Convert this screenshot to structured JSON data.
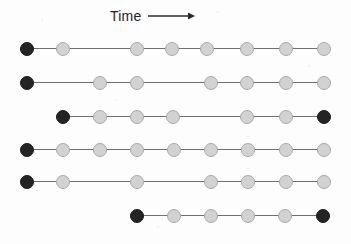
{
  "figure": {
    "width": 351,
    "height": 244,
    "background_color": "#fdfdfd",
    "axis": {
      "label": "Time",
      "arrow_icon": "arrow-right-icon",
      "arrow_direction": "right",
      "arrow_color": "#2b2b2b",
      "label_left": 110,
      "label_top": 7,
      "arrow_length": 46
    },
    "colors": {
      "node_dark": "#242424",
      "node_dark_border": "#1a1a1a",
      "node_light": "#d2d2d2",
      "node_light_border": "#a9a9a9",
      "connector": "#6f6f6f"
    },
    "node_diameter": 14,
    "rows": [
      {
        "name": "timeline-row-1",
        "center_y": 49,
        "nodes": [
          {
            "x": 27,
            "state": "dark"
          },
          {
            "x": 63,
            "state": "light"
          },
          {
            "x": 137,
            "state": "light"
          },
          {
            "x": 172,
            "state": "light"
          },
          {
            "x": 207,
            "state": "light"
          },
          {
            "x": 247,
            "state": "light"
          },
          {
            "x": 286,
            "state": "light"
          },
          {
            "x": 324,
            "state": "light"
          }
        ]
      },
      {
        "name": "timeline-row-2",
        "center_y": 83,
        "nodes": [
          {
            "x": 27,
            "state": "dark"
          },
          {
            "x": 100,
            "state": "light"
          },
          {
            "x": 137,
            "state": "light"
          },
          {
            "x": 211,
            "state": "light"
          },
          {
            "x": 247,
            "state": "light"
          },
          {
            "x": 286,
            "state": "light"
          },
          {
            "x": 324,
            "state": "light"
          }
        ]
      },
      {
        "name": "timeline-row-3",
        "center_y": 117,
        "nodes": [
          {
            "x": 63,
            "state": "dark"
          },
          {
            "x": 100,
            "state": "light"
          },
          {
            "x": 137,
            "state": "light"
          },
          {
            "x": 173,
            "state": "light"
          },
          {
            "x": 247,
            "state": "light"
          },
          {
            "x": 286,
            "state": "light"
          },
          {
            "x": 324,
            "state": "dark"
          }
        ]
      },
      {
        "name": "timeline-row-4",
        "center_y": 150,
        "nodes": [
          {
            "x": 27,
            "state": "dark"
          },
          {
            "x": 63,
            "state": "light"
          },
          {
            "x": 100,
            "state": "light"
          },
          {
            "x": 137,
            "state": "light"
          },
          {
            "x": 174,
            "state": "light"
          },
          {
            "x": 211,
            "state": "light"
          },
          {
            "x": 248,
            "state": "light"
          },
          {
            "x": 286,
            "state": "light"
          },
          {
            "x": 324,
            "state": "light"
          }
        ]
      },
      {
        "name": "timeline-row-5",
        "center_y": 182,
        "nodes": [
          {
            "x": 27,
            "state": "dark"
          },
          {
            "x": 63,
            "state": "light"
          },
          {
            "x": 137,
            "state": "light"
          },
          {
            "x": 211,
            "state": "light"
          },
          {
            "x": 248,
            "state": "light"
          },
          {
            "x": 286,
            "state": "light"
          },
          {
            "x": 324,
            "state": "light"
          }
        ]
      },
      {
        "name": "timeline-row-6",
        "center_y": 216,
        "nodes": [
          {
            "x": 137,
            "state": "dark"
          },
          {
            "x": 174,
            "state": "light"
          },
          {
            "x": 211,
            "state": "light"
          },
          {
            "x": 248,
            "state": "light"
          },
          {
            "x": 285,
            "state": "light"
          },
          {
            "x": 323,
            "state": "dark"
          }
        ]
      }
    ]
  }
}
